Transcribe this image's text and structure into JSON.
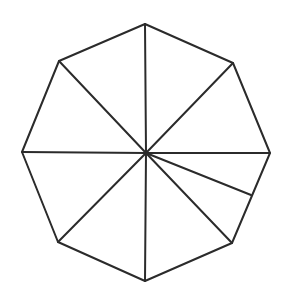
{
  "figure": {
    "stroke_color": "#2b2b2b",
    "background": "#ffffff",
    "center": [
      146,
      153
    ],
    "vertices": [
      [
        145,
        24
      ],
      [
        233,
        63
      ],
      [
        270,
        153
      ],
      [
        232,
        243
      ],
      [
        145,
        281
      ],
      [
        58,
        242
      ],
      [
        22,
        152
      ],
      [
        59,
        61
      ]
    ],
    "spokes_to_vertices": [
      0,
      1,
      2,
      3,
      4,
      5,
      6,
      7
    ],
    "extra_segment": {
      "from": [
        146,
        153
      ],
      "to": [
        251,
        195
      ],
      "note": "segment from center to midpoint-ish of lower-right edge"
    }
  }
}
